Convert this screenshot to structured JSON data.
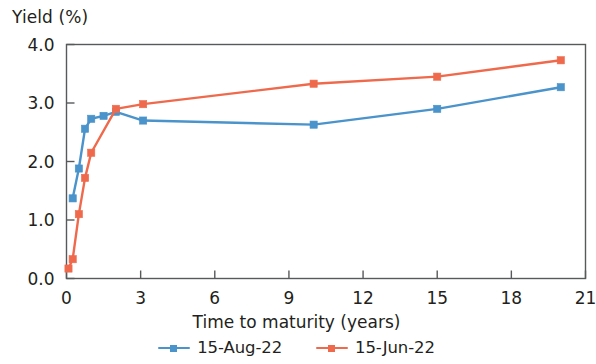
{
  "chart_data": {
    "type": "line",
    "title": "",
    "xlabel": "Time to maturity (years)",
    "ylabel": "Yield (%)",
    "xlim": [
      0,
      21
    ],
    "ylim": [
      0.0,
      4.0
    ],
    "xticks": [
      "0",
      "3",
      "6",
      "9",
      "12",
      "15",
      "18",
      "21"
    ],
    "xtick_values": [
      0,
      3,
      6,
      9,
      12,
      15,
      18,
      21
    ],
    "yticks": [
      "0.0",
      "1.0",
      "2.0",
      "3.0",
      "4.0"
    ],
    "ytick_values": [
      0.0,
      1.0,
      2.0,
      3.0,
      4.0
    ],
    "grid": false,
    "legend_position": "bottom",
    "series": [
      {
        "name": "15-Aug-22",
        "color": "#4a93cb",
        "marker": "square",
        "points": [
          [
            0.25,
            1.37
          ],
          [
            0.5,
            1.88
          ],
          [
            0.75,
            2.56
          ],
          [
            1.0,
            2.73
          ],
          [
            1.5,
            2.78
          ],
          [
            2.0,
            2.85
          ],
          [
            3.1,
            2.7
          ],
          [
            10.0,
            2.63
          ],
          [
            15.0,
            2.9
          ],
          [
            20.0,
            3.27
          ]
        ]
      },
      {
        "name": "15-Jun-22",
        "color": "#ef6a4c",
        "marker": "square",
        "points": [
          [
            0.08,
            0.17
          ],
          [
            0.25,
            0.33
          ],
          [
            0.5,
            1.1
          ],
          [
            0.75,
            1.72
          ],
          [
            1.0,
            2.15
          ],
          [
            2.0,
            2.9
          ],
          [
            3.1,
            2.98
          ],
          [
            10.0,
            3.33
          ],
          [
            15.0,
            3.45
          ],
          [
            20.0,
            3.73
          ]
        ]
      }
    ]
  },
  "axes": {
    "y_title": "Yield (%)",
    "x_title": "Time to maturity (years)"
  },
  "legend": {
    "items": [
      {
        "label": "15-Aug-22",
        "color": "#4a93cb"
      },
      {
        "label": "15-Jun-22",
        "color": "#ef6a4c"
      }
    ]
  },
  "colors": {
    "series_blue": "#4a93cb",
    "series_orange": "#ef6a4c",
    "axis": "#58595b",
    "text": "#231f20"
  }
}
